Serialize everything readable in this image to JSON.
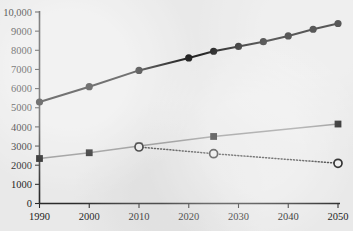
{
  "chart_data": {
    "type": "line",
    "title": "",
    "subtitle": "",
    "xlabel": "",
    "ylabel": "",
    "xlim": [
      1990,
      2050
    ],
    "ylim": [
      0,
      10000
    ],
    "grid": false,
    "legend_position": "none",
    "x_ticks": [
      1990,
      2000,
      2010,
      2020,
      2030,
      2040,
      2050
    ],
    "x_tick_labels": [
      "1990",
      "2000",
      "2010",
      "2020",
      "2030",
      "2040",
      "2050"
    ],
    "y_ticks": [
      0,
      1000,
      2000,
      3000,
      4000,
      5000,
      6000,
      7000,
      8000,
      9000,
      10000
    ],
    "y_tick_labels": [
      "0",
      "1000",
      "2000",
      "3000",
      "4000",
      "5000",
      "6000",
      "7000",
      "8000",
      "9000",
      "10,000"
    ],
    "series": [
      {
        "name": "total",
        "marker": "filled-circle",
        "line_style": "solid",
        "color": "#111111",
        "x": [
          1990,
          2000,
          2010,
          2020,
          2025,
          2030,
          2035,
          2040,
          2045,
          2050
        ],
        "values": [
          5300,
          6100,
          6950,
          7600,
          7950,
          8200,
          8450,
          8750,
          9100,
          9400
        ]
      },
      {
        "name": "secondary-solid",
        "marker": "filled-square",
        "line_style": "solid",
        "color": "#8a8a8a",
        "x": [
          1990,
          2000,
          2010,
          2025,
          2050
        ],
        "values": [
          2350,
          2650,
          3000,
          3500,
          4150
        ]
      },
      {
        "name": "secondary-dotted",
        "marker": "open-circle",
        "line_style": "dotted",
        "color": "#333333",
        "x": [
          2010,
          2025,
          2050
        ],
        "values": [
          2950,
          2600,
          2100
        ]
      }
    ]
  },
  "axes": {
    "y_axis_name": "y-axis",
    "x_axis_name": "x-axis"
  }
}
